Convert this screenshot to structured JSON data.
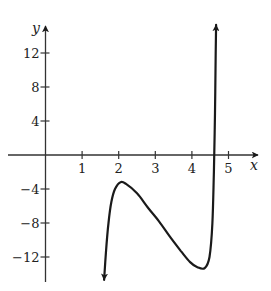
{
  "chart_data": {
    "type": "line",
    "title": "",
    "xlabel": "x",
    "ylabel": "y",
    "xlim": [
      -0.8,
      5.6
    ],
    "ylim": [
      -15.5,
      15.5
    ],
    "grid": false,
    "legend": null,
    "x_ticks": [
      1,
      2,
      3,
      4,
      5
    ],
    "x_tick_labels": [
      "1",
      "2",
      "3",
      "4",
      "5"
    ],
    "y_ticks": [
      12,
      8,
      4,
      -4,
      -8,
      -12
    ],
    "y_tick_labels": [
      "12",
      "8",
      "4",
      "−4",
      "−8",
      "−12"
    ],
    "series": [
      {
        "name": "f(x)",
        "description": "Curve with arrows at both ends; enters from bottom near x=1.6, rises to a local max near (2.05, -3.2), decreases to a local min near (4.35, -13.3), then rises steeply to above y=15 near x=4.65",
        "x": [
          1.6,
          1.65,
          1.72,
          1.8,
          1.9,
          2.05,
          2.2,
          2.5,
          2.8,
          3.1,
          3.4,
          3.7,
          3.95,
          4.15,
          4.35,
          4.48,
          4.56,
          4.6,
          4.63,
          4.65,
          4.66
        ],
        "y": [
          -14.7,
          -11.5,
          -8.0,
          -5.5,
          -4.0,
          -3.2,
          -3.4,
          -4.5,
          -6.2,
          -7.8,
          -9.6,
          -11.3,
          -12.6,
          -13.2,
          -13.3,
          -12.0,
          -8.0,
          -2.0,
          5.0,
          12.0,
          15.3
        ],
        "arrow_start": true,
        "arrow_end": true,
        "color": "#1a1a1a"
      }
    ],
    "key_points": {
      "local_max": [
        2.05,
        -3.2
      ],
      "local_min": [
        4.35,
        -13.3
      ]
    }
  }
}
